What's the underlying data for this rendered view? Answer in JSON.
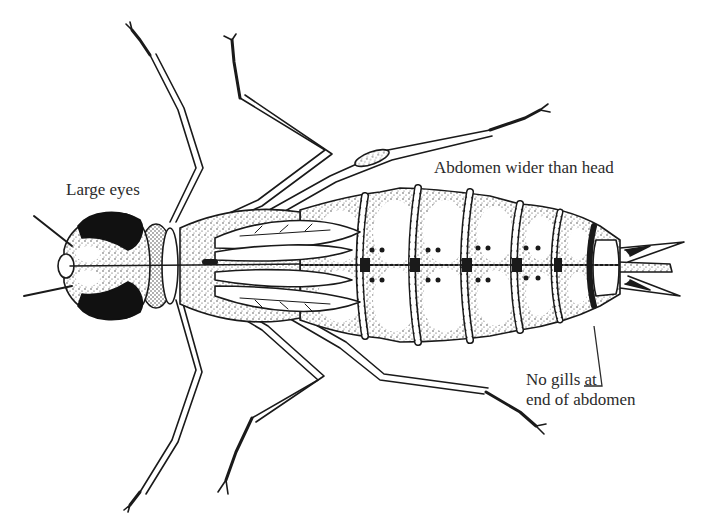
{
  "figure": {
    "labels": {
      "eyes": "Large eyes",
      "abdomen": "Abdomen wider than head",
      "gills_line1": "No gills at",
      "gills_line2": "end of abdomen"
    },
    "colors": {
      "ink": "#1a1a1a",
      "text": "#2b2b2b",
      "background": "#ffffff"
    }
  }
}
